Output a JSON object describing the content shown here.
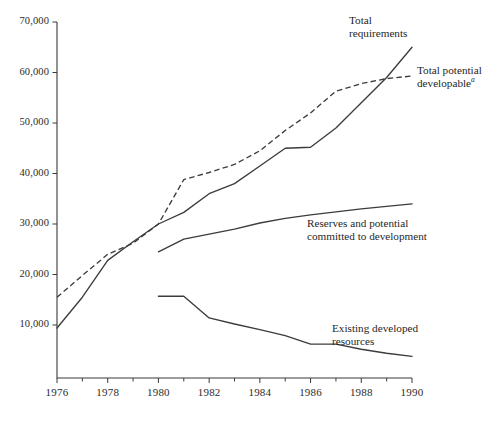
{
  "chart_data": {
    "type": "line",
    "title": "",
    "subtitle": "",
    "xlabel": "",
    "ylabel": "",
    "xlim": [
      1976,
      1990
    ],
    "ylim": [
      0,
      70000
    ],
    "grid": false,
    "legend_position": "inline-annotations",
    "x_tick_labels": [
      "1976",
      "1978",
      "1980",
      "1982",
      "1984",
      "1986",
      "1988",
      "1990"
    ],
    "x_tick_values": [
      1976,
      1978,
      1980,
      1982,
      1984,
      1986,
      1988,
      1990
    ],
    "x_minor_tick_values": [
      1977,
      1979,
      1981,
      1983,
      1985,
      1987,
      1989
    ],
    "y_tick_labels": [
      "10,000",
      "20,000",
      "30,000",
      "40,000",
      "50,000",
      "60,000",
      "70,000"
    ],
    "y_tick_values": [
      10000,
      20000,
      30000,
      40000,
      50000,
      60000,
      70000
    ],
    "series": [
      {
        "name": "Total requirements",
        "style": "solid",
        "x": [
          1976,
          1977,
          1978,
          1979,
          1980,
          1981,
          1982,
          1983,
          1984,
          1985,
          1986,
          1987,
          1988,
          1989,
          1990
        ],
        "values": [
          9400,
          15500,
          22800,
          26500,
          30000,
          32300,
          36000,
          38000,
          41500,
          45000,
          45200,
          49000,
          54000,
          59000,
          65000
        ]
      },
      {
        "name": "Total potential developable",
        "name_note": "a",
        "style": "dashed",
        "x": [
          1976,
          1977,
          1978,
          1979,
          1980,
          1981,
          1982,
          1983,
          1984,
          1985,
          1986,
          1987,
          1988,
          1989,
          1990
        ],
        "values": [
          15500,
          19800,
          24000,
          26200,
          30000,
          38800,
          40200,
          41800,
          44500,
          48500,
          52000,
          56300,
          57800,
          58800,
          59300
        ]
      },
      {
        "name": "Reserves and potential committed to development",
        "style": "solid",
        "x": [
          1980,
          1981,
          1982,
          1983,
          1984,
          1985,
          1986,
          1987,
          1988,
          1989,
          1990
        ],
        "values": [
          24500,
          27000,
          28000,
          29000,
          30200,
          31100,
          31800,
          32400,
          33000,
          33500,
          34000
        ]
      },
      {
        "name": "Existing developed resources",
        "style": "solid",
        "x": [
          1980,
          1981,
          1982,
          1983,
          1984,
          1985,
          1986,
          1987,
          1988,
          1989,
          1990
        ],
        "values": [
          15700,
          15700,
          11400,
          10200,
          9100,
          7900,
          6200,
          6200,
          5200,
          4400,
          3800
        ]
      }
    ],
    "annotations": [
      {
        "id": "total-requirements",
        "text": "Total\nrequirements",
        "line1": "Total",
        "line2": "requirements"
      },
      {
        "id": "total-potential-developable",
        "text": "Total potential developable",
        "line1": "Total potential",
        "line2": "developable",
        "note": "a"
      },
      {
        "id": "reserves-and-potential",
        "text": "Reserves and potential committed to development",
        "line1": "Reserves and potential",
        "line2": "committed to development"
      },
      {
        "id": "existing-developed-resources",
        "text": "Existing developed resources",
        "line1": "Existing developed",
        "line2": "resources"
      }
    ],
    "colors": {
      "line": "#3c3c3c",
      "axis": "#3a3a3a",
      "text": "#1f1f1f",
      "background": "#ffffff"
    }
  }
}
